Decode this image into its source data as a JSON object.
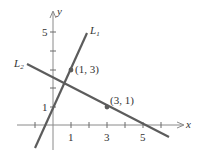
{
  "diagram": {
    "type": "coordinate-plane-lines",
    "axes": {
      "x_label": "x",
      "y_label": "y",
      "x_tick_labels": [
        {
          "value": 1,
          "text": "1"
        },
        {
          "value": 3,
          "text": "3"
        },
        {
          "value": 5,
          "text": "5"
        }
      ],
      "y_tick_labels": [
        {
          "value": 1,
          "text": "1"
        },
        {
          "value": 5,
          "text": "5"
        }
      ],
      "x_ticks": [
        -1,
        1,
        2,
        3,
        4,
        5,
        6
      ],
      "y_ticks": [
        1,
        2,
        3,
        4,
        5
      ]
    },
    "lines": [
      {
        "name": "L1",
        "label_main": "L",
        "label_sub": "1",
        "passes_through": [
          [
            1,
            3
          ],
          [
            0,
            1
          ]
        ],
        "slope": 2
      },
      {
        "name": "L2",
        "label_main": "L",
        "label_sub": "2",
        "passes_through": [
          [
            1,
            3
          ],
          [
            3,
            1
          ]
        ],
        "slope": -1
      }
    ],
    "points": [
      {
        "x": 1,
        "y": 3,
        "label": "(1, 3)"
      },
      {
        "x": 3,
        "y": 1,
        "label": "(3, 1)"
      }
    ],
    "colors": {
      "line": "#5c5c5c",
      "axis": "#8a8a8a",
      "text": "#333333"
    }
  }
}
